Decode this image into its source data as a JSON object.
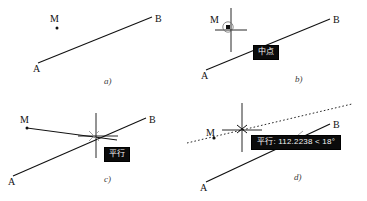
{
  "figure": {
    "background_color": "#ffffff",
    "ink_color": "#111111",
    "tooltip_background": "#0b0b0b",
    "tooltip_text_color": "#f2f2f2"
  },
  "panels": [
    {
      "id": "a",
      "caption": "a)",
      "labels": {
        "m": "M",
        "a": "A",
        "b": "B"
      },
      "tooltip": null,
      "description": "Line segment A-B with an isolated point M above the left end; no cursor shown."
    },
    {
      "id": "b",
      "caption": "b)",
      "labels": {
        "m": "M",
        "a": "A",
        "b": "B"
      },
      "tooltip": "中点",
      "description": "Crosshair cursor snapped onto point M, showing a square node marker inside a circular snap aperture and the 中点 (midpoint) snap tooltip."
    },
    {
      "id": "c",
      "caption": "c)",
      "labels": {
        "m": "M",
        "a": "A",
        "b": "B"
      },
      "tooltip": "平行",
      "description": "Rubber-band line drawn from M toward the crosshair; the 平行 (parallel) snap tooltip appears when the new line is parallel to A-B."
    },
    {
      "id": "d",
      "caption": "d)",
      "labels": {
        "m": "M",
        "a": "A",
        "b": "B"
      },
      "tooltip": "平行: 112.2238 < 18°",
      "tooltip_parts": {
        "mode": "平行",
        "separator": ":",
        "length": "112.2238",
        "angle_symbol": "<",
        "angle": "18°"
      },
      "description": "Dotted parallel alignment path through M with the 平行 tooltip reporting the polar length 112.2238 and the angle 18 degrees."
    }
  ]
}
